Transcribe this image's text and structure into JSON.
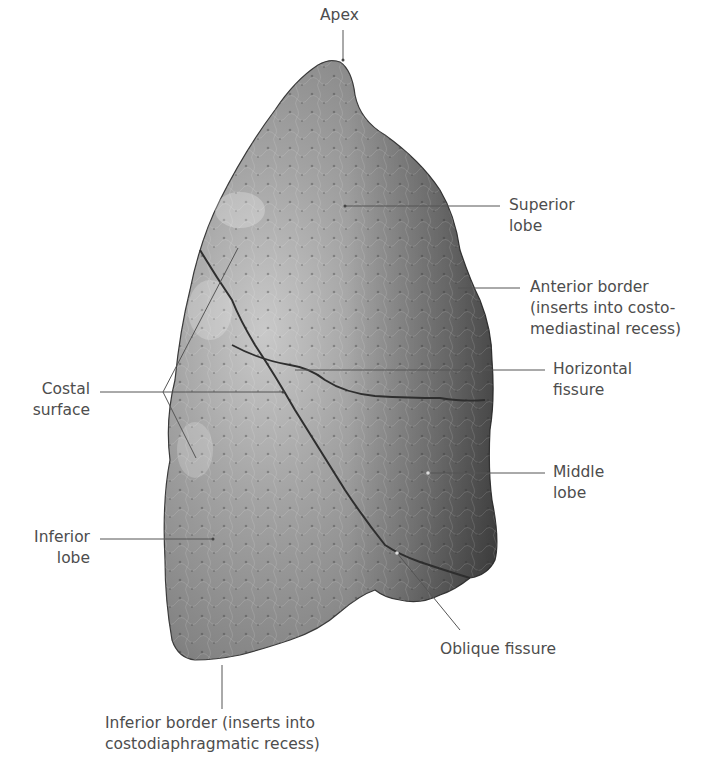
{
  "figure": {
    "colors": {
      "lung_fill_light": "#bdbdbd",
      "lung_fill_mid": "#8f8f8f",
      "lung_fill_dark": "#5e5e5e",
      "fissure": "#2e2e2e",
      "leader_line": "#555555",
      "label_text": "#4d4d4d"
    }
  },
  "labels": {
    "apex": "Apex",
    "superior_lobe": "Superior\nlobe",
    "anterior_border": "Anterior border\n(inserts into costo-\nmediastinal recess)",
    "horizontal_fissure": "Horizontal\nfissure",
    "costal_surface": "Costal\nsurface",
    "middle_lobe": "Middle\nlobe",
    "inferior_lobe": "Inferior\nlobe",
    "oblique_fissure": "Oblique fissure",
    "inferior_border": "Inferior border (inserts into\ncostodiaphragmatic recess)"
  }
}
